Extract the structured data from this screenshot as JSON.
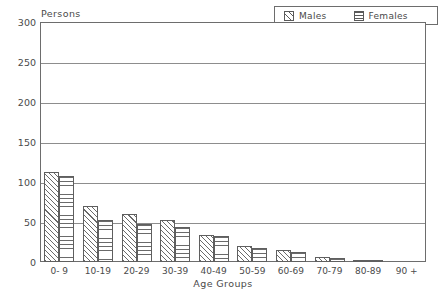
{
  "chart_data": {
    "type": "bar",
    "title": "",
    "xlabel": "Age Groups",
    "ylabel": "Persons",
    "ylim": [
      0,
      300
    ],
    "yticks": [
      0,
      50,
      100,
      150,
      200,
      250,
      300
    ],
    "grid": true,
    "legend_position": "top-right",
    "categories": [
      "0- 9",
      "10-19",
      "20-29",
      "30-39",
      "40-49",
      "50-59",
      "60-69",
      "70-79",
      "80-89",
      "90 +"
    ],
    "series": [
      {
        "name": "Males",
        "values": [
          112,
          70,
          60,
          52,
          34,
          20,
          15,
          6,
          2,
          0
        ]
      },
      {
        "name": "Females",
        "values": [
          108,
          52,
          48,
          44,
          32,
          18,
          12,
          5,
          2,
          0
        ]
      }
    ]
  },
  "legend": {
    "males_label": "Males",
    "females_label": "Females",
    "males_pattern": "diagonal-hatch-swatch",
    "females_pattern": "horizontal-lines-swatch"
  },
  "axes": {
    "y_title": "Persons",
    "x_title": "Age Groups"
  },
  "colors": {
    "frame": "#6d6d6d",
    "grid": "#8d8d8d",
    "bar_outline": "#5f5f5f",
    "hatch": "#6a6a6a",
    "text": "#4a4a4a",
    "background": "#ffffff"
  }
}
